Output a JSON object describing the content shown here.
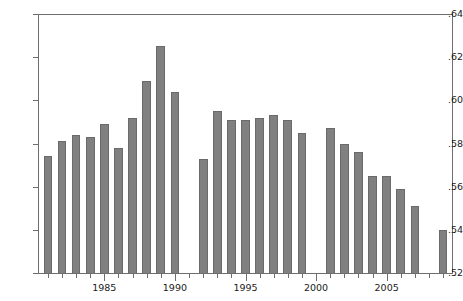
{
  "chart_data": {
    "type": "bar",
    "title": "",
    "subtitle": "",
    "xlabel": "",
    "ylabel": "",
    "xlim": [
      1980.3,
      2009.7
    ],
    "ylim": [
      0.52,
      0.64
    ],
    "grid": false,
    "legend": null,
    "bar_color": "#808080",
    "axis_color": "#6e6e6e",
    "y_ticks": [
      ".52",
      ".54",
      ".56",
      ".58",
      ".60",
      ".62",
      ".64"
    ],
    "y_tick_values": [
      0.52,
      0.54,
      0.56,
      0.58,
      0.6,
      0.62,
      0.64
    ],
    "x_ticks_major": [
      "1985",
      "1990",
      "1995",
      "2000",
      "2005"
    ],
    "x_tick_major_values": [
      1985,
      1990,
      1995,
      2000,
      2005
    ],
    "x_tick_minor_values": [
      1981,
      1982,
      1983,
      1984,
      1986,
      1987,
      1988,
      1989,
      1991,
      1992,
      1993,
      1994,
      1996,
      1997,
      1998,
      1999,
      2001,
      2002,
      2003,
      2004,
      2006,
      2007,
      2008,
      2009
    ],
    "categories": [
      1981,
      1982,
      1983,
      1984,
      1985,
      1986,
      1987,
      1988,
      1989,
      1990,
      1992,
      1993,
      1994,
      1995,
      1996,
      1997,
      1998,
      1999,
      2001,
      2002,
      2003,
      2004,
      2005,
      2006,
      2007,
      2009
    ],
    "values": [
      0.574,
      0.581,
      0.584,
      0.583,
      0.589,
      0.578,
      0.592,
      0.609,
      0.625,
      0.604,
      0.573,
      0.595,
      0.591,
      0.591,
      0.592,
      0.593,
      0.591,
      0.585,
      0.587,
      0.58,
      0.576,
      0.565,
      0.565,
      0.559,
      0.551,
      0.54
    ],
    "missing_years": [
      1991,
      2000,
      2008
    ]
  }
}
